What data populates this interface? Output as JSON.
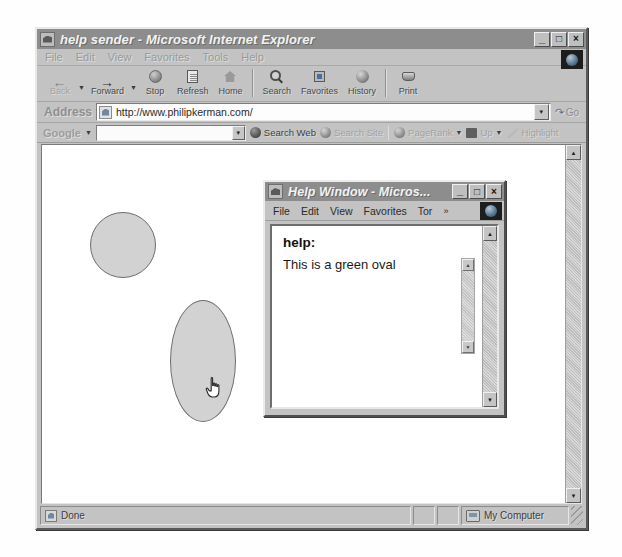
{
  "main_window": {
    "title": "help sender - Microsoft Internet Explorer",
    "icon": "ie-page-icon",
    "window_buttons": {
      "minimize": "_",
      "maximize": "□",
      "close": "×"
    },
    "menu": [
      "File",
      "Edit",
      "View",
      "Favorites",
      "Tools",
      "Help"
    ],
    "toolbar": [
      {
        "label": "Back",
        "icon": "back-arrow-icon",
        "disabled": true,
        "dropdown": true
      },
      {
        "label": "Forward",
        "icon": "forward-arrow-icon",
        "disabled": false,
        "dropdown": true
      },
      {
        "label": "Stop",
        "icon": "stop-icon",
        "disabled": false,
        "dropdown": false
      },
      {
        "label": "Refresh",
        "icon": "refresh-page-icon",
        "disabled": false,
        "dropdown": false
      },
      {
        "label": "Home",
        "icon": "home-icon",
        "disabled": false,
        "dropdown": false
      },
      {
        "label": "Search",
        "icon": "magnifier-icon",
        "disabled": false,
        "dropdown": false
      },
      {
        "label": "Favorites",
        "icon": "favorites-star-icon",
        "disabled": false,
        "dropdown": false
      },
      {
        "label": "History",
        "icon": "history-clock-icon",
        "disabled": false,
        "dropdown": false
      },
      {
        "label": "Print",
        "icon": "printer-icon",
        "disabled": false,
        "dropdown": false
      }
    ],
    "address": {
      "label": "Address",
      "url": "http://www.philipkerman.com/",
      "go_label": "Go",
      "icon": "page-icon",
      "dropdown_icon": "chevron-down-icon"
    },
    "google_bar": {
      "logo": "Google",
      "caret": "▼",
      "search_value": "",
      "buttons": [
        {
          "label": "Search Web",
          "icon": "binoculars-icon",
          "dim": false
        },
        {
          "label": "Search Site",
          "icon": "globe-icon",
          "dim": true
        },
        {
          "label": "PageRank",
          "icon": "pagerank-icon",
          "dim": true,
          "caret": "▼"
        },
        {
          "label": "Up",
          "icon": "folder-up-icon",
          "dim": true,
          "caret": "▼"
        },
        {
          "label": "Highlight",
          "icon": "highlighter-icon",
          "dim": true
        }
      ]
    },
    "status_bar": {
      "message": "Done",
      "message_icon": "page-icon",
      "zone": "My Computer",
      "zone_icon": "my-computer-icon"
    },
    "scrollbar": {
      "up_arrow": "▲",
      "down_arrow": "▼"
    }
  },
  "canvas": {
    "shapes": [
      {
        "name": "gray-circle",
        "kind": "circle",
        "fill": "#d2d2d2",
        "stroke": "#6d6d6d"
      },
      {
        "name": "gray-tall-oval",
        "kind": "oval",
        "fill": "#d2d2d2",
        "stroke": "#6d6d6d"
      }
    ],
    "cursor": "pointing-hand-cursor"
  },
  "help_window": {
    "title": "Help Window - Micros...",
    "icon": "ie-page-icon",
    "window_buttons": {
      "minimize": "_",
      "maximize": "□",
      "close": "×"
    },
    "menu": [
      "File",
      "Edit",
      "View",
      "Favorites",
      "Tor"
    ],
    "menu_overflow": "»",
    "content": {
      "heading": "help:",
      "body": "This is a green oval"
    },
    "scrollbar": {
      "up_arrow": "▲",
      "down_arrow": "▼"
    },
    "inner_scrollbar": {
      "up_arrow": "▲",
      "down_arrow": "▼"
    }
  }
}
